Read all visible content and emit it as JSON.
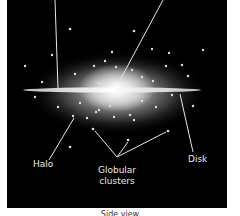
{
  "diagram": {
    "title_caption": "Side view",
    "labels": {
      "halo": "Halo",
      "globular_clusters_line1": "Globular",
      "globular_clusters_line2": "clusters",
      "disk": "Disk"
    },
    "colors": {
      "background": "#000000",
      "glow": "#ffffff",
      "label": "#e8e8e8",
      "frame": "#ffffff"
    }
  }
}
